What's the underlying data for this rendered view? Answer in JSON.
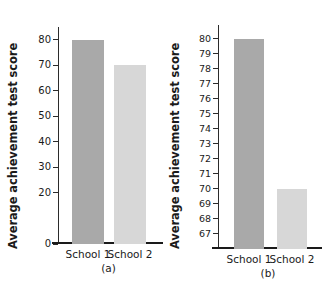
{
  "figure": {
    "ylabel": "Average achievement test score",
    "panels": [
      {
        "caption": "(a)",
        "categories": [
          "School 1",
          "School 2"
        ],
        "values": [
          80,
          70
        ],
        "yticks": [
          0,
          20,
          30,
          40,
          50,
          60,
          70,
          80
        ],
        "ylim": [
          0,
          85
        ],
        "bar_colors": [
          "#a9a9a9",
          "#d7d7d7"
        ]
      },
      {
        "caption": "(b)",
        "categories": [
          "School 1",
          "School 2"
        ],
        "values": [
          80,
          70
        ],
        "yticks": [
          67,
          68,
          69,
          70,
          71,
          72,
          73,
          74,
          75,
          76,
          77,
          78,
          79,
          80
        ],
        "ylim": [
          66.0,
          80.9
        ],
        "bar_colors": [
          "#a9a9a9",
          "#d7d7d7"
        ]
      }
    ]
  },
  "chart_data": {
    "type": "bar",
    "title": "",
    "xlabel": "",
    "ylabel": "Average achievement test score",
    "categories": [
      "School 1",
      "School 2"
    ],
    "panels": [
      {
        "label": "(a)",
        "type": "bar",
        "categories": [
          "School 1",
          "School 2"
        ],
        "values": [
          80,
          70
        ],
        "ylim": [
          0,
          85
        ],
        "yticks": [
          0,
          20,
          30,
          40,
          50,
          60,
          70,
          80
        ],
        "ylabel": "Average achievement test score",
        "xlabel": "",
        "grid": false,
        "legend": false,
        "note": "Full y-axis beginning at zero; the two bars look similar in height."
      },
      {
        "label": "(b)",
        "type": "bar",
        "categories": [
          "School 1",
          "School 2"
        ],
        "values": [
          80,
          70
        ],
        "ylim": [
          66.0,
          80.9
        ],
        "yticks": [
          67,
          68,
          69,
          70,
          71,
          72,
          73,
          74,
          75,
          76,
          77,
          78,
          79,
          80
        ],
        "ylabel": "Average achievement test score",
        "xlabel": "",
        "grid": false,
        "legend": false,
        "note": "Truncated y-axis beginning near 66; the same two values look dramatically different."
      }
    ]
  }
}
